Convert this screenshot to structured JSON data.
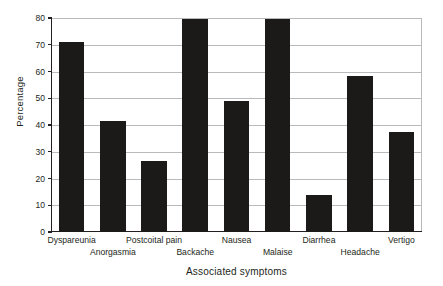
{
  "chart_data": {
    "type": "bar",
    "title": "",
    "subtitle": "",
    "xlabel": "Associated symptoms",
    "ylabel": "Percentage",
    "categories": [
      "Dyspareunia",
      "Anorgasmia",
      "Postcoital pain",
      "Backache",
      "Nausea",
      "Malaise",
      "Diarrhea",
      "Headache",
      "Vertigo"
    ],
    "values": [
      71,
      41.5,
      26.5,
      79.5,
      49,
      79.5,
      14,
      58.5,
      37.5
    ],
    "ylim": [
      0,
      80
    ],
    "yticks": [
      0,
      10,
      20,
      30,
      40,
      50,
      60,
      70,
      80
    ],
    "ytick_labels": [
      "0",
      "10",
      "20",
      "30",
      "40",
      "50",
      "60",
      "70",
      "80"
    ],
    "grid": true,
    "grid_axis": "y",
    "legend": false,
    "legend_position": "none",
    "bar_color": "#1c1a19",
    "grid_color": "#b9babc",
    "axis_color": "#231f20",
    "background_color": "#ffffff",
    "label_rows": [
      0,
      1,
      0,
      1,
      0,
      1,
      0,
      1,
      0
    ]
  }
}
